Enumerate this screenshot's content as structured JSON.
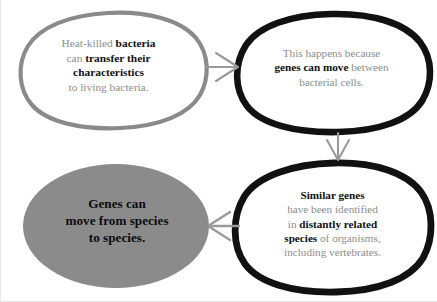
{
  "diagram": {
    "colors": {
      "background": "#ffffff",
      "gray_outline": "#8a8a8a",
      "black_outline": "#111111",
      "gray_fill": "#8b8b8b",
      "body_text": "#8d8d8d",
      "emphasis_text": "#111111",
      "arrow": "#9a9a9a"
    },
    "nodes": [
      {
        "id": "node-1",
        "name": "heat-killed-bacteria-node",
        "style": "gray-outline-ellipse",
        "lines": [
          {
            "segments": [
              {
                "text": "Heat-killed ",
                "bold": false
              },
              {
                "text": "bacteria",
                "bold": true
              }
            ]
          },
          {
            "segments": [
              {
                "text": "can ",
                "bold": false
              },
              {
                "text": "transfer their",
                "bold": true
              }
            ]
          },
          {
            "segments": [
              {
                "text": "characteristics",
                "bold": true
              }
            ]
          },
          {
            "segments": [
              {
                "text": "to living bacteria.",
                "bold": false
              }
            ]
          }
        ]
      },
      {
        "id": "node-2",
        "name": "genes-can-move-node",
        "style": "black-outline-ellipse",
        "lines": [
          {
            "segments": [
              {
                "text": "This happens because",
                "bold": false
              }
            ]
          },
          {
            "segments": [
              {
                "text": "genes can move",
                "bold": true
              },
              {
                "text": " between",
                "bold": false
              }
            ]
          },
          {
            "segments": [
              {
                "text": "bacterial cells.",
                "bold": false
              }
            ]
          }
        ]
      },
      {
        "id": "node-3",
        "name": "similar-genes-node",
        "style": "black-outline-ellipse",
        "lines": [
          {
            "segments": [
              {
                "text": "Similar genes",
                "bold": true
              }
            ]
          },
          {
            "segments": [
              {
                "text": "have been identified",
                "bold": false
              }
            ]
          },
          {
            "segments": [
              {
                "text": "in ",
                "bold": false
              },
              {
                "text": "distantly related",
                "bold": true
              }
            ]
          },
          {
            "segments": [
              {
                "text": "species",
                "bold": true
              },
              {
                "text": " of organisms,",
                "bold": false
              }
            ]
          },
          {
            "segments": [
              {
                "text": "including vertebrates.",
                "bold": false
              }
            ]
          }
        ]
      },
      {
        "id": "node-4",
        "name": "conclusion-node",
        "style": "gray-filled-ellipse",
        "lines": [
          {
            "segments": [
              {
                "text": "Genes can",
                "bold": true
              }
            ]
          },
          {
            "segments": [
              {
                "text": "move from species",
                "bold": true
              }
            ]
          },
          {
            "segments": [
              {
                "text": "to species.",
                "bold": true
              }
            ]
          }
        ]
      }
    ],
    "arrows": [
      {
        "id": "arrow-1",
        "name": "arrow-node1-to-node2",
        "direction": "right",
        "from": "node-1",
        "to": "node-2"
      },
      {
        "id": "arrow-2",
        "name": "arrow-node2-to-node3",
        "direction": "down",
        "from": "node-2",
        "to": "node-3"
      },
      {
        "id": "arrow-3",
        "name": "arrow-node3-to-node4",
        "direction": "left",
        "from": "node-3",
        "to": "node-4"
      }
    ]
  }
}
